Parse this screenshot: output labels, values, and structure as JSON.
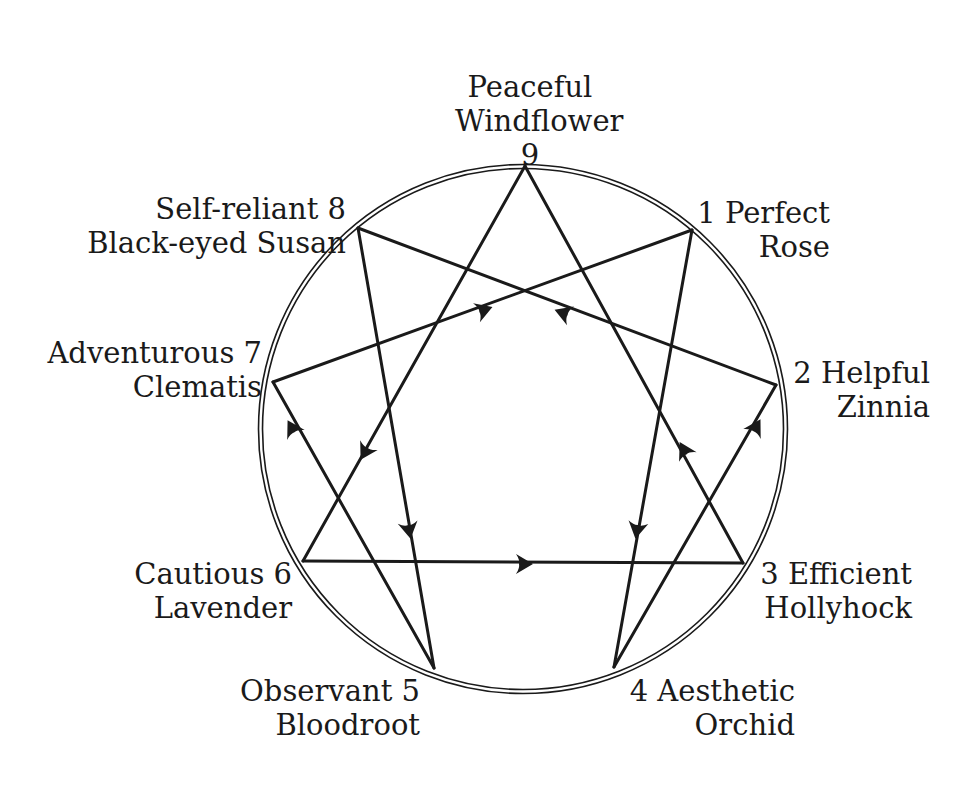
{
  "diagram": {
    "type": "enneagram",
    "stroke_color": "#1a1a1a",
    "background": "#ffffff",
    "circle": {
      "cx": 523,
      "cy": 429,
      "r": 262
    },
    "points": [
      {
        "id": "9",
        "number": "9",
        "trait": "Peaceful",
        "flower": "Windflower",
        "x": 525,
        "y": 166
      },
      {
        "id": "1",
        "number": "1",
        "trait": "Perfect",
        "flower": "Rose",
        "x": 692,
        "y": 230
      },
      {
        "id": "2",
        "number": "2",
        "trait": "Helpful",
        "flower": "Zinnia",
        "x": 776,
        "y": 385
      },
      {
        "id": "3",
        "number": "3",
        "trait": "Efficient",
        "flower": "Hollyhock",
        "x": 743,
        "y": 563
      },
      {
        "id": "4",
        "number": "4",
        "trait": "Aesthetic",
        "flower": "Orchid",
        "x": 614,
        "y": 667
      },
      {
        "id": "5",
        "number": "5",
        "trait": "Observant",
        "flower": "Bloodroot",
        "x": 434,
        "y": 668
      },
      {
        "id": "6",
        "number": "6",
        "trait": "Cautious",
        "flower": "Lavender",
        "x": 303,
        "y": 561
      },
      {
        "id": "7",
        "number": "7",
        "trait": "Adventurous",
        "flower": "Clematis",
        "x": 273,
        "y": 382
      },
      {
        "id": "8",
        "number": "8",
        "trait": "Self-reliant",
        "flower": "Black-eyed Susan",
        "x": 358,
        "y": 228
      }
    ],
    "edges": [
      {
        "from": "9",
        "to": "3"
      },
      {
        "from": "3",
        "to": "6"
      },
      {
        "from": "6",
        "to": "9"
      },
      {
        "from": "1",
        "to": "4"
      },
      {
        "from": "4",
        "to": "2"
      },
      {
        "from": "2",
        "to": "8"
      },
      {
        "from": "8",
        "to": "5"
      },
      {
        "from": "5",
        "to": "7"
      },
      {
        "from": "7",
        "to": "1"
      }
    ],
    "arrows": [
      {
        "edge": "7-1",
        "x": 484,
        "y": 310,
        "direction": "toward 1"
      },
      {
        "edge": "2-8",
        "x": 563,
        "y": 313,
        "direction": "toward 8"
      },
      {
        "edge": "9-6",
        "x": 365,
        "y": 452,
        "direction": "toward 6"
      },
      {
        "edge": "5-7",
        "x": 292,
        "y": 428,
        "direction": "toward 7"
      },
      {
        "edge": "8-5",
        "x": 409,
        "y": 530,
        "direction": "toward 5"
      },
      {
        "edge": "1-4",
        "x": 637,
        "y": 530,
        "direction": "toward 4"
      },
      {
        "edge": "3-9",
        "x": 684,
        "y": 450,
        "direction": "toward 9"
      },
      {
        "edge": "4-2",
        "x": 756,
        "y": 427,
        "direction": "toward 2"
      },
      {
        "edge": "6-3",
        "x": 524,
        "y": 564,
        "direction": "toward 3"
      }
    ]
  },
  "labels": {
    "p9": {
      "line1": "Peaceful",
      "line2": "Windflower",
      "line3": "9"
    },
    "p1": {
      "line1": "1 Perfect",
      "line2": "Rose"
    },
    "p2": {
      "line1": "2 Helpful",
      "line2": "Zinnia"
    },
    "p3": {
      "line1": "3 Efficient",
      "line2": "Hollyhock"
    },
    "p4": {
      "line1": "4 Aesthetic",
      "line2": "Orchid"
    },
    "p5": {
      "line1": "Observant 5",
      "line2": "Bloodroot"
    },
    "p6": {
      "line1": "Cautious 6",
      "line2": "Lavender"
    },
    "p7": {
      "line1": "Adventurous 7",
      "line2": "Clematis"
    },
    "p8": {
      "line1": "Self-reliant 8",
      "line2": "Black-eyed Susan"
    }
  }
}
